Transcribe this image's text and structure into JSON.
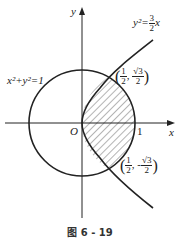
{
  "figure": {
    "caption": "图 6 - 19",
    "axes": {
      "x_label": "x",
      "y_label": "y",
      "origin_label": "O",
      "tick_1_label": "1"
    },
    "curves": {
      "circle": {
        "equation": "x²+y²=1",
        "lhs": "x²+y²=1"
      },
      "parabola": {
        "lhs": "y²=",
        "coef_num": "3",
        "coef_den": "2",
        "var": "x"
      }
    },
    "points": [
      {
        "x_num": "1",
        "x_den": "2",
        "y_sign": "",
        "y_num": "√3",
        "y_den": "2"
      },
      {
        "x_num": "1",
        "x_den": "2",
        "y_sign": "-",
        "y_num": "√3",
        "y_den": "2"
      }
    ],
    "colors": {
      "stroke": "#222222",
      "hatch": "#444444",
      "background": "#ffffff"
    }
  }
}
